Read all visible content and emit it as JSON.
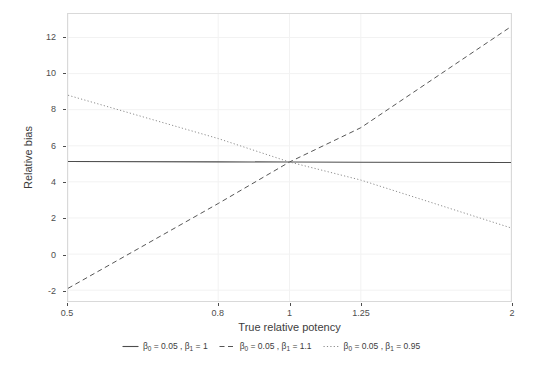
{
  "chart_data": {
    "type": "line",
    "title": "",
    "xlabel": "True relative potency",
    "ylabel": "Relative bias",
    "xscale": "log",
    "xlim": [
      0.5,
      2
    ],
    "ylim": [
      -2.6,
      13.3
    ],
    "xticks": [
      "0.5",
      "0.8",
      "1",
      "1.25",
      "2"
    ],
    "xtick_values": [
      0.5,
      0.8,
      1,
      1.25,
      2
    ],
    "yticks": [
      "-2",
      "0",
      "2",
      "4",
      "6",
      "8",
      "10",
      "12"
    ],
    "ytick_values": [
      -2,
      0,
      2,
      4,
      6,
      8,
      10,
      12
    ],
    "grid": true,
    "legend_position": "bottom",
    "x": [
      0.5,
      0.8,
      1,
      1.25,
      2
    ],
    "series": [
      {
        "name": "beta0 = 0.05 , beta1 = 1",
        "linestyle": "solid",
        "color": "#4d4d4d",
        "values": [
          5.13,
          5.11,
          5.1,
          5.09,
          5.07
        ]
      },
      {
        "name": "beta0 = 0.05 , beta1 = 1.1",
        "linestyle": "dashed",
        "color": "#555555",
        "values": [
          -1.9,
          2.8,
          5.1,
          7.0,
          12.6
        ]
      },
      {
        "name": "beta0 = 0.05 , beta1 = 0.95",
        "linestyle": "dotted",
        "color": "#8c8c8c",
        "values": [
          8.8,
          6.4,
          5.1,
          4.1,
          1.45
        ]
      }
    ]
  },
  "axes": {
    "x_title": "True relative potency",
    "y_title": "Relative bias"
  },
  "legend": {
    "items": [
      {
        "key": "solid-line-key",
        "beta0_symbol": "β",
        "beta0_sub": "0",
        "beta0_value": "= 0.05",
        "separator": ",",
        "beta1_symbol": "β",
        "beta1_sub": "1",
        "beta1_value": "= 1"
      },
      {
        "key": "dashed-line-key",
        "beta0_symbol": "β",
        "beta0_sub": "0",
        "beta0_value": "= 0.05",
        "separator": ",",
        "beta1_symbol": "β",
        "beta1_sub": "1",
        "beta1_value": "= 1.1"
      },
      {
        "key": "dotted-line-key",
        "beta0_symbol": "β",
        "beta0_sub": "0",
        "beta0_value": "= 0.05",
        "separator": ",",
        "beta1_symbol": "β",
        "beta1_sub": "1",
        "beta1_value": "= 0.95"
      }
    ]
  },
  "style": {
    "panel_border_color": "#d9d9d9",
    "grid_color": "#f2f2f2",
    "text_color": "#4d4d4d",
    "background": "#ffffff"
  }
}
